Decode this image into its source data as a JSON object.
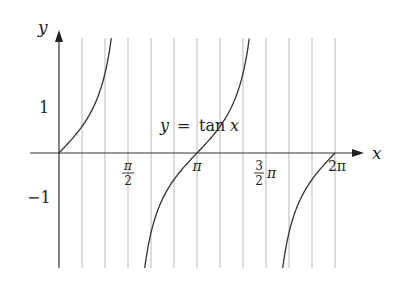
{
  "chart_data": {
    "type": "line",
    "title": "",
    "function": "tan",
    "annotation": "y = tan x",
    "annotation_parts": {
      "lhs": "y",
      "eq": "=",
      "fn": "tan",
      "arg": "x"
    },
    "xlabel": "x",
    "ylabel": "y",
    "xlim": [
      0,
      6.2832
    ],
    "ylim": [
      -2.5,
      2.5
    ],
    "grid": {
      "vertical": true,
      "horizontal": false,
      "spacing": "pi/6"
    },
    "x_ticks": [
      {
        "value": 1.5708,
        "label": "π/2",
        "num": "π",
        "den": "2",
        "suffix": ""
      },
      {
        "value": 3.1416,
        "label": "π",
        "num": "",
        "den": "",
        "suffix": "π"
      },
      {
        "value": 4.7124,
        "label": "3/2 π",
        "num": "3",
        "den": "2",
        "suffix": "π"
      },
      {
        "value": 6.2832,
        "label": "2π",
        "num": "",
        "den": "",
        "suffix": "2π"
      }
    ],
    "y_ticks": [
      {
        "value": 1,
        "label": "1"
      },
      {
        "value": -1,
        "label": "−1"
      }
    ],
    "series": [
      {
        "name": "tan x (branch 1)",
        "x": [
          0,
          0.2,
          0.4,
          0.6,
          0.785,
          0.9,
          1.0,
          1.1,
          1.19
        ],
        "y": [
          0,
          0.203,
          0.423,
          0.684,
          1.0,
          1.26,
          1.557,
          1.965,
          2.5
        ]
      },
      {
        "name": "tan x (branch 2)",
        "x": [
          1.951,
          2.0,
          2.2,
          2.4,
          2.6,
          2.8,
          3.1416,
          3.4,
          3.6,
          3.8,
          4.0,
          4.2,
          4.33
        ],
        "y": [
          -2.5,
          -2.185,
          -1.374,
          -0.916,
          -0.602,
          -0.356,
          0,
          0.264,
          0.493,
          0.774,
          1.158,
          1.778,
          2.5
        ]
      },
      {
        "name": "tan x (branch 3)",
        "x": [
          5.093,
          5.2,
          5.4,
          5.6,
          5.8,
          6.0,
          6.2832
        ],
        "y": [
          -2.5,
          -1.886,
          -1.134,
          -0.698,
          -0.524,
          -0.291,
          0
        ]
      }
    ]
  },
  "labels": {
    "x_axis": "x",
    "y_axis": "y",
    "y_one": "1",
    "y_minus_one": "−1",
    "pi": "π",
    "two_pi": "2π",
    "half_num": "π",
    "half_den": "2",
    "three_half_num": "3",
    "three_half_den": "2",
    "three_half_suffix": "π",
    "eq_lhs": "y",
    "eq_sign": "=",
    "eq_fn": "tan",
    "eq_arg": "x"
  }
}
